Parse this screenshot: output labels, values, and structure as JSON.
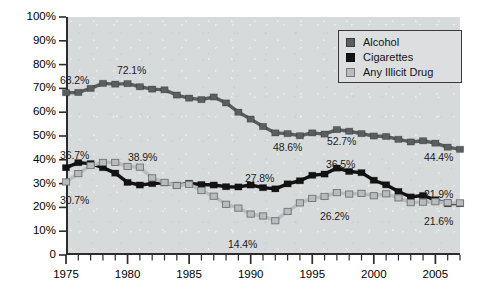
{
  "chart_data": {
    "type": "line",
    "title": "",
    "subtitle": "",
    "xlabel": "",
    "ylabel": "",
    "xlim": [
      1975,
      2007
    ],
    "ylim": [
      0,
      100
    ],
    "grid": false,
    "legend_position": "top-right",
    "y_ticks": [
      "0",
      "10%",
      "20%",
      "30%",
      "40%",
      "50%",
      "60%",
      "70%",
      "80%",
      "90%",
      "100%"
    ],
    "y_tick_values": [
      0,
      10,
      20,
      30,
      40,
      50,
      60,
      70,
      80,
      90,
      100
    ],
    "x_ticks": [
      "1975",
      "1980",
      "1985",
      "1990",
      "1995",
      "2000",
      "2005"
    ],
    "x_tick_values": [
      1975,
      1980,
      1985,
      1990,
      1995,
      2000,
      2005
    ],
    "x": [
      1975,
      1976,
      1977,
      1978,
      1979,
      1980,
      1981,
      1982,
      1983,
      1984,
      1985,
      1986,
      1987,
      1988,
      1989,
      1990,
      1991,
      1992,
      1993,
      1994,
      1995,
      1996,
      1997,
      1998,
      1999,
      2000,
      2001,
      2002,
      2003,
      2004,
      2005,
      2006,
      2007
    ],
    "series": [
      {
        "name": "Alcohol",
        "color": "#5a5e60",
        "values": [
          68.2,
          68.3,
          70.0,
          72.1,
          71.8,
          72.0,
          70.7,
          69.7,
          69.4,
          67.2,
          65.9,
          65.3,
          66.4,
          63.9,
          60.0,
          57.1,
          54.0,
          51.3,
          51.0,
          50.1,
          51.3,
          50.8,
          52.7,
          52.0,
          51.0,
          50.0,
          49.8,
          48.6,
          47.5,
          48.0,
          47.0,
          45.3,
          44.4
        ],
        "labels": [
          {
            "x": 1975,
            "value": "68.2%"
          },
          {
            "x": 1978,
            "value": "72.1%"
          },
          {
            "x": 1992,
            "value": "48.6%"
          },
          {
            "x": 1997,
            "value": "52.7%"
          },
          {
            "x": 2007,
            "value": "44.4%"
          }
        ]
      },
      {
        "name": "Cigarettes",
        "color": "#131313",
        "values": [
          36.7,
          38.8,
          38.4,
          36.7,
          34.4,
          30.5,
          29.4,
          30.0,
          30.3,
          29.3,
          30.1,
          29.6,
          29.4,
          28.7,
          28.6,
          29.4,
          28.3,
          27.8,
          29.9,
          31.2,
          33.5,
          34.0,
          36.5,
          35.1,
          34.6,
          31.4,
          29.5,
          26.7,
          24.4,
          25.0,
          23.2,
          21.6,
          21.6
        ],
        "labels": [
          {
            "x": 1975,
            "value": "36.7%"
          },
          {
            "x": 1992,
            "value": "27.8%"
          },
          {
            "x": 1997,
            "value": "36.5%"
          },
          {
            "x": 2007,
            "value": "21.6%"
          }
        ]
      },
      {
        "name": "Any Illicit Drug",
        "color": "#b9bcbe",
        "values": [
          30.7,
          34.2,
          37.6,
          38.9,
          38.9,
          37.2,
          36.9,
          32.4,
          30.5,
          29.2,
          29.7,
          27.1,
          24.7,
          21.3,
          19.7,
          17.2,
          16.4,
          14.4,
          18.3,
          21.9,
          23.8,
          24.6,
          26.2,
          25.6,
          25.9,
          24.9,
          25.7,
          24.0,
          22.0,
          22.2,
          22.4,
          22.0,
          21.9
        ],
        "labels": [
          {
            "x": 1975,
            "value": "30.7%"
          },
          {
            "x": 1979,
            "value": "38.9%"
          },
          {
            "x": 1992,
            "value": "14.4%"
          },
          {
            "x": 1998,
            "value": "26.2%"
          },
          {
            "x": 2007,
            "value": "21.9%"
          }
        ]
      }
    ],
    "annotations": [
      {
        "id": "a1",
        "text": "68.2%",
        "left": 60,
        "top": 74,
        "series": "Alcohol"
      },
      {
        "id": "a2",
        "text": "72.1%",
        "left": 117,
        "top": 64,
        "series": "Alcohol"
      },
      {
        "id": "a3",
        "text": "48.6%",
        "left": 273,
        "top": 141,
        "series": "Alcohol"
      },
      {
        "id": "a4",
        "text": "52.7%",
        "left": 327,
        "top": 135,
        "series": "Alcohol"
      },
      {
        "id": "a5",
        "text": "44.4%",
        "left": 424,
        "top": 151,
        "series": "Alcohol"
      },
      {
        "id": "c1",
        "text": "36.7%",
        "left": 60,
        "top": 149,
        "series": "Cigarettes"
      },
      {
        "id": "c2",
        "text": "27.8%",
        "left": 245,
        "top": 172,
        "series": "Cigarettes"
      },
      {
        "id": "c3",
        "text": "36.5%",
        "left": 326,
        "top": 158,
        "series": "Cigarettes"
      },
      {
        "id": "c4",
        "text": "21.9%",
        "left": 424,
        "top": 188,
        "series": "Any Illicit Drug"
      },
      {
        "id": "d1",
        "text": "30.7%",
        "left": 60,
        "top": 194,
        "series": "Any Illicit Drug"
      },
      {
        "id": "d2",
        "text": "38.9%",
        "left": 128,
        "top": 151,
        "series": "Any Illicit Drug"
      },
      {
        "id": "d3",
        "text": "14.4%",
        "left": 228,
        "top": 238,
        "series": "Any Illicit Drug"
      },
      {
        "id": "d4",
        "text": "26.2%",
        "left": 320,
        "top": 210,
        "series": "Any Illicit Drug"
      },
      {
        "id": "c5",
        "text": "21.6%",
        "left": 424,
        "top": 215,
        "series": "Cigarettes"
      }
    ]
  },
  "legend": {
    "items": [
      {
        "label": "Alcohol",
        "color": "#5a5e60"
      },
      {
        "label": "Cigarettes",
        "color": "#131313"
      },
      {
        "label": "Any Illicit Drug",
        "color": "#b9bcbe"
      }
    ]
  }
}
